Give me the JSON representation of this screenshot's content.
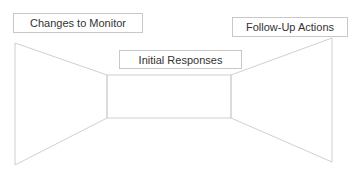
{
  "diagram": {
    "title": "",
    "stroke_color": "#d0d0d0",
    "box_border_color": "#c8c8c8",
    "text_color": "#333333",
    "labels": {
      "changes_to_monitor": "Changes to Monitor",
      "initial_responses": "Initial Responses",
      "follow_up_actions": "Follow-Up Actions"
    },
    "shapes": {
      "left_wall": [
        [
          15,
          43
        ],
        [
          107,
          75
        ],
        [
          107,
          118
        ],
        [
          15,
          165
        ]
      ],
      "back_wall": [
        [
          107,
          75
        ],
        [
          231,
          75
        ],
        [
          231,
          118
        ],
        [
          107,
          118
        ]
      ],
      "right_wall": [
        [
          231,
          75
        ],
        [
          332,
          38
        ],
        [
          332,
          162
        ],
        [
          231,
          118
        ]
      ]
    }
  }
}
